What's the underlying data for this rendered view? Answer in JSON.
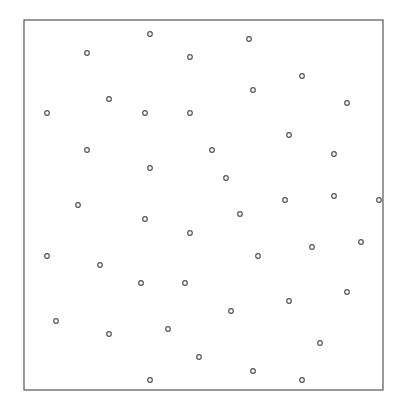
{
  "chart_data": {
    "type": "scatter",
    "title": "",
    "xlabel": "",
    "ylabel": "",
    "grid": false,
    "legend": null,
    "frame": {
      "left": 24,
      "top": 20,
      "right": 383,
      "bottom": 390
    },
    "marker": {
      "shape": "open-circle",
      "radius": 2.3,
      "stroke": "#555555"
    },
    "points": [
      [
        150,
        34
      ],
      [
        87,
        53
      ],
      [
        190,
        57
      ],
      [
        249,
        39
      ],
      [
        302,
        76
      ],
      [
        253,
        90
      ],
      [
        109,
        99
      ],
      [
        47,
        113
      ],
      [
        145,
        113
      ],
      [
        190,
        113
      ],
      [
        347,
        103
      ],
      [
        289,
        135
      ],
      [
        87,
        150
      ],
      [
        212,
        150
      ],
      [
        334,
        154
      ],
      [
        150,
        168
      ],
      [
        226,
        178
      ],
      [
        78,
        205
      ],
      [
        285,
        200
      ],
      [
        334,
        196
      ],
      [
        379,
        200
      ],
      [
        240,
        214
      ],
      [
        145,
        219
      ],
      [
        190,
        233
      ],
      [
        312,
        247
      ],
      [
        361,
        242
      ],
      [
        47,
        256
      ],
      [
        258,
        256
      ],
      [
        100,
        265
      ],
      [
        141,
        283
      ],
      [
        185,
        283
      ],
      [
        347,
        292
      ],
      [
        289,
        301
      ],
      [
        231,
        311
      ],
      [
        56,
        321
      ],
      [
        168,
        329
      ],
      [
        109,
        334
      ],
      [
        320,
        343
      ],
      [
        199,
        357
      ],
      [
        253,
        371
      ],
      [
        302,
        380
      ],
      [
        150,
        380
      ]
    ]
  }
}
